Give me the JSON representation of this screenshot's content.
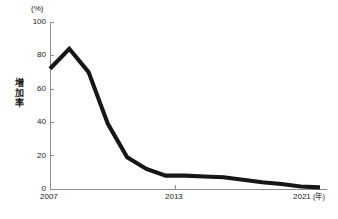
{
  "chart_data": {
    "type": "line",
    "title": "",
    "subtitle": "",
    "xlabel": "年",
    "ylabel": "増加率",
    "unit_label": "(%)",
    "x": [
      2007,
      2008,
      2009,
      2010,
      2011,
      2012,
      2013,
      2014,
      2015,
      2016,
      2017,
      2018,
      2019,
      2020,
      2021
    ],
    "values": [
      72,
      84,
      70,
      39,
      19,
      12,
      8,
      8,
      7.5,
      7,
      5.5,
      4,
      3,
      1.5,
      1
    ],
    "series": [
      {
        "name": "増加率",
        "values": [
          72,
          84,
          70,
          39,
          19,
          12,
          8,
          8,
          7.5,
          7,
          5.5,
          4,
          3,
          1.5,
          1
        ],
        "color": "#161616"
      }
    ],
    "xlim": [
      2007,
      2021
    ],
    "ylim": [
      0,
      100
    ],
    "yticks": [
      0,
      20,
      40,
      60,
      80,
      100
    ],
    "ytick_labels": [
      "0",
      "20",
      "40",
      "60",
      "80",
      "100"
    ],
    "xticks": [
      2007,
      2013,
      2021
    ],
    "xtick_labels": [
      "2007",
      "2013",
      "2021"
    ],
    "x_axis_unit": "(年)",
    "grid": false,
    "legend": false,
    "legend_position": "none"
  },
  "axis": {
    "y_title_chars": [
      "増",
      "加",
      "率"
    ],
    "x_end_label": "2021",
    "x_end_unit": "(年)"
  },
  "colors": {
    "line": "#161616",
    "axis": "#8d8d8d",
    "text": "#1a1a1a",
    "background": "#ffffff"
  }
}
